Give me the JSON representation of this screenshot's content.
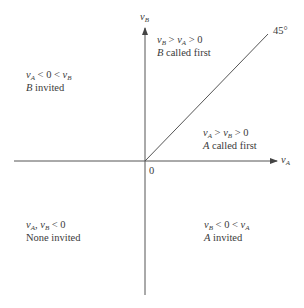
{
  "diagram": {
    "axes": {
      "x_label": "v",
      "x_label_sub": "A",
      "y_label": "v",
      "y_label_sub": "B",
      "origin_label": "0",
      "diagonal_label": "45°"
    },
    "regions": [
      {
        "id": "b-called-first",
        "condition": "v_B > v_A > 0",
        "outcome": "B called first"
      },
      {
        "id": "b-invited",
        "condition": "v_A < 0 < v_B",
        "outcome": "B invited"
      },
      {
        "id": "a-called-first",
        "condition": "v_A > v_B > 0",
        "outcome": "A called first"
      },
      {
        "id": "none-invited",
        "condition": "v_A, v_B < 0",
        "outcome": "None invited"
      },
      {
        "id": "a-invited",
        "condition": "v_B < 0 < v_A",
        "outcome": "A invited"
      }
    ],
    "text": {
      "b_called_first_outcome_rest": " called first",
      "b_invited_outcome_rest": " invited",
      "a_called_first_outcome_rest": " called first",
      "none_invited_outcome": "None invited",
      "a_invited_outcome_rest": " invited",
      "A": "A",
      "B": "B",
      "v": "v",
      "gt": " > ",
      "lt": " < ",
      "zero": "0",
      "comma": ", "
    },
    "colors": {
      "axis": "#555555",
      "text": "#3a3a3a"
    }
  }
}
